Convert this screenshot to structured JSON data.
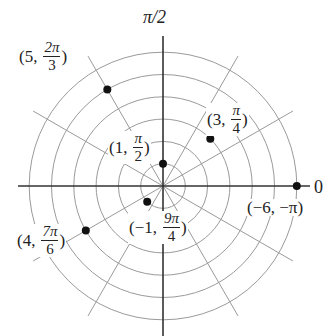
{
  "diagram": {
    "type": "polar-coordinate-plot",
    "center": {
      "x": 163,
      "y": 186
    },
    "ring_step_px": 22.3,
    "ring_count": 6,
    "spoke_angles_deg": [
      30,
      60,
      120,
      150,
      210,
      240,
      300,
      330
    ],
    "spoke_length_px": 150,
    "colors": {
      "grid": "#9a9a9a",
      "axis": "#333333",
      "point": "#111111",
      "text": "#222222"
    },
    "axis_labels": {
      "top": "π/2",
      "right": "0"
    },
    "points": [
      {
        "r": 5,
        "theta": "2π/3",
        "r_text": "5",
        "theta_num": "2π",
        "theta_den": "3",
        "plot_r": 5,
        "plot_angle_deg": 120,
        "label_x": 12,
        "label_y": 63
      },
      {
        "r": 3,
        "theta": "π/4",
        "r_text": "3",
        "theta_num": "π",
        "theta_den": "4",
        "plot_r": 3,
        "plot_angle_deg": 45,
        "label_x": 207,
        "label_y": 103
      },
      {
        "r": 1,
        "theta": "π/2",
        "r_text": "1",
        "theta_num": "π",
        "theta_den": "2",
        "plot_r": 1,
        "plot_angle_deg": 90,
        "label_x": 108,
        "label_y": 133
      },
      {
        "r": -6,
        "theta": "-π",
        "r_text": "−6",
        "theta_text": "−π",
        "plot_r": 6,
        "plot_angle_deg": 0,
        "label_x": 246,
        "label_y": 196
      },
      {
        "r": -1,
        "theta": "9π/4",
        "r_text": "−1",
        "theta_num": "9π",
        "theta_den": "4",
        "plot_r": 1,
        "plot_angle_deg": 225,
        "label_x": 128,
        "label_y": 210
      },
      {
        "r": 4,
        "theta": "7π/6",
        "r_text": "4",
        "theta_num": "7π",
        "theta_den": "6",
        "plot_r": 4,
        "plot_angle_deg": 210,
        "label_x": 14,
        "label_y": 219
      }
    ],
    "labels": {
      "p1": {
        "open": "(5,",
        "num": "2π",
        "den": "3",
        "close": ")"
      },
      "p2": {
        "open": "(3,",
        "num": "π",
        "den": "4",
        "close": ")"
      },
      "p3": {
        "open": "(1,",
        "num": "π",
        "den": "2",
        "close": ")"
      },
      "p4": {
        "text": "(−6, −π)"
      },
      "p5": {
        "open": "(−1,",
        "num": "9π",
        "den": "4",
        "close": ")"
      },
      "p6": {
        "open": "(4,",
        "num": "7π",
        "den": "6",
        "close": ")"
      }
    }
  }
}
